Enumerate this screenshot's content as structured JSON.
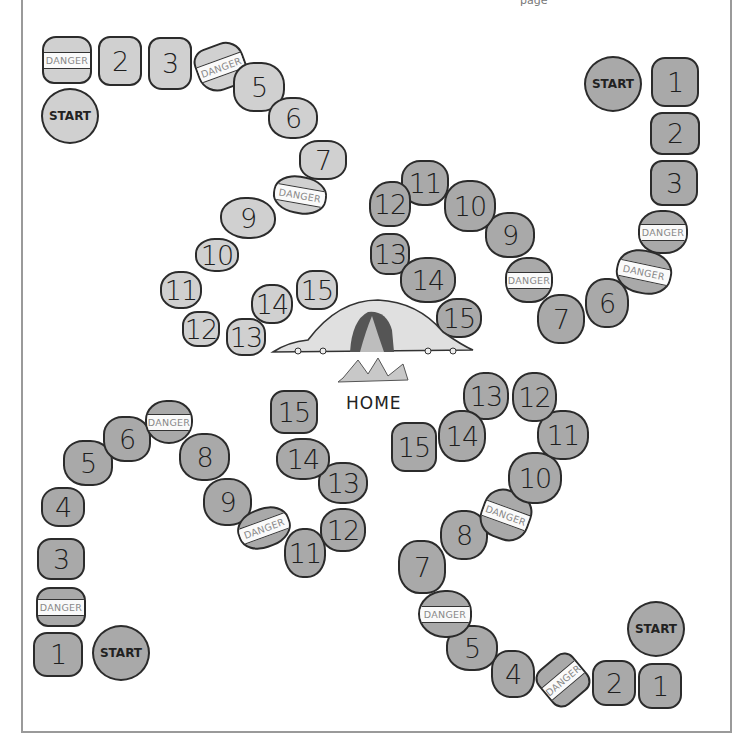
{
  "board": {
    "title": "",
    "header_fragment": "page",
    "colors": {
      "light_path": "#d0d0d0",
      "dark_path": "#a9a9a9",
      "outline": "#2b2b2b",
      "frame": "#9a9a9a",
      "danger_band": "#fafafa"
    },
    "home": {
      "label": "HOME",
      "icon": "cave-with-campfire-icon"
    },
    "start_label": "START",
    "danger_label": "DANGER",
    "paths": [
      {
        "id": "top-left",
        "shade": "light",
        "squares": [
          "DANGER",
          "2",
          "3",
          "DANGER",
          "5",
          "6",
          "7",
          "DANGER",
          "9",
          "10",
          "11",
          "12",
          "13",
          "14",
          "15"
        ]
      },
      {
        "id": "top-right",
        "shade": "dark",
        "squares": [
          "1",
          "2",
          "3",
          "DANGER",
          "DANGER",
          "6",
          "7",
          "DANGER",
          "9",
          "10",
          "11",
          "12",
          "13",
          "14",
          "15"
        ]
      },
      {
        "id": "bottom-left",
        "shade": "dark",
        "squares": [
          "1",
          "DANGER",
          "3",
          "4",
          "5",
          "6",
          "DANGER",
          "8",
          "9",
          "DANGER",
          "11",
          "12",
          "13",
          "14",
          "15"
        ]
      },
      {
        "id": "bottom-right",
        "shade": "dark",
        "squares": [
          "1",
          "2",
          "DANGER",
          "4",
          "5",
          "DANGER",
          "7",
          "8",
          "DANGER",
          "10",
          "11",
          "12",
          "13",
          "14",
          "15"
        ]
      }
    ]
  }
}
